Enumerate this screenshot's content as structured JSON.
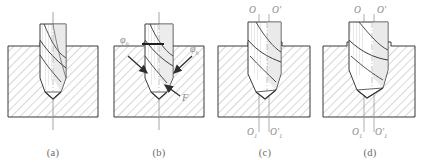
{
  "figure": {
    "panel_count": 4,
    "colors": {
      "outline": "#3a3a3a",
      "hatch": "#8c8c8c",
      "workpiece_fill": "#f2f2f2",
      "drill_fill": "#ffffff",
      "drill_shade": "#d9d9d9",
      "axis": "#9a9a9a",
      "label": "#8a8a8a",
      "caption": "#6a6a6a",
      "background": "#ffffff"
    }
  },
  "panels": [
    {
      "id": "a",
      "caption": "(a)",
      "description": "Drill aligned on centre axis, tip just entering the hole; centre line shown vertically through the drill and workpiece.",
      "labels": []
    },
    {
      "id": "b",
      "caption": "(b)",
      "description": "Drill engaged with cutting forces indicated; angle phi sub h marked at left with inward arrows and feed force F at lower right.",
      "labels": [
        {
          "name": "angle-phi-left",
          "text": "φ",
          "sub": "h"
        },
        {
          "name": "angle-phi-right",
          "text": "φ",
          "sub": "h"
        },
        {
          "name": "force-f",
          "text": "F",
          "sub": ""
        }
      ]
    },
    {
      "id": "c",
      "caption": "(c)",
      "description": "Drill displaced laterally; nominal axis O-O1 and deflected axis O'-O1' shown as two parallel centre lines.",
      "labels": [
        {
          "name": "axis-o-top",
          "text": "O",
          "sub": ""
        },
        {
          "name": "axis-o-prime-top",
          "text": "O",
          "sub": "",
          "prime": true
        },
        {
          "name": "axis-o1-bottom",
          "text": "O",
          "sub": "1"
        },
        {
          "name": "axis-o1-prime-bottom",
          "text": "O",
          "sub": "1",
          "prime": true
        }
      ]
    },
    {
      "id": "d",
      "caption": "(d)",
      "description": "Drill further skewed into the workpiece wall producing an enlarged, off-centre hole; same axis labels O-O1 and O'-O1'.",
      "labels": [
        {
          "name": "axis-o-top",
          "text": "O",
          "sub": ""
        },
        {
          "name": "axis-o-prime-top",
          "text": "O",
          "sub": "",
          "prime": true
        },
        {
          "name": "axis-o1-bottom",
          "text": "O",
          "sub": "1"
        },
        {
          "name": "axis-o1-prime-bottom",
          "text": "O",
          "sub": "1",
          "prime": true
        }
      ]
    }
  ]
}
